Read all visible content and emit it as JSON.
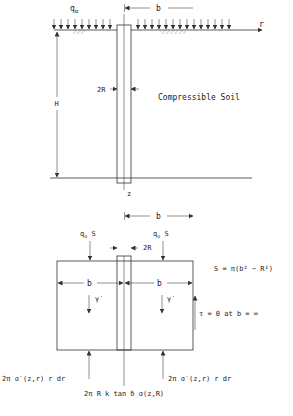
{
  "upper_diagram": {
    "load_label": "q",
    "load_sub": "o",
    "width_label": "b",
    "radial_axis_label": "r",
    "depth_label": "H",
    "pile_diameter_label": "2R",
    "soil_label": "Compressible Soil",
    "vertical_axis_label": "z"
  },
  "lower_diagram": {
    "width_label_top": "b",
    "left_load_label": "q",
    "left_load_sub": "o",
    "left_load_suffix": " S",
    "right_load_label": "q",
    "right_load_sub": "o",
    "right_load_suffix": " S",
    "pile_diameter_label": "2R",
    "area_formula": "S = π(b² −  R²)",
    "left_width_label": "b",
    "right_width_label": "b",
    "unit_weight_left": "γ′",
    "unit_weight_right": "γ′",
    "boundary_condition": "τ = 0 at b = ∞",
    "left_reaction": "2π σ′(z,r) r dr",
    "right_reaction": "2π σ′(z,r) r dr",
    "pile_friction": "2π R k tan δ σ(z,R)"
  },
  "colors": {
    "line": "#333333",
    "text": "#222222",
    "background": "#ffffff"
  }
}
